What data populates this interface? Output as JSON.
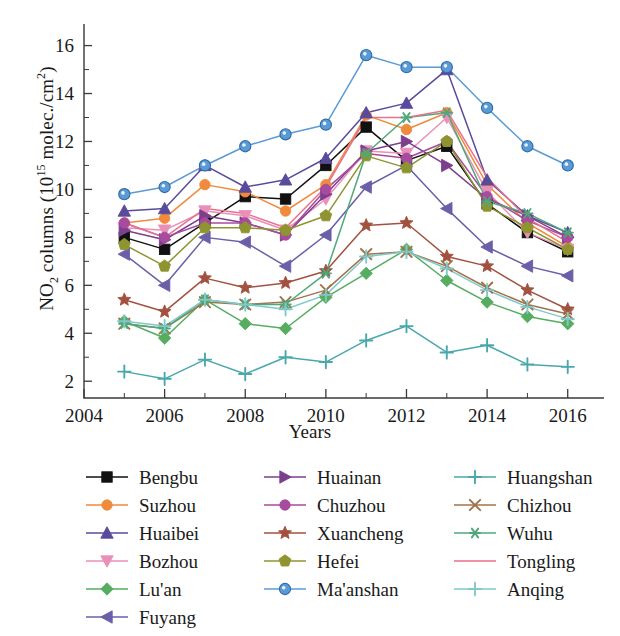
{
  "figure": {
    "y_axis_title_html": "NO<sub>2</sub> columns (10<sup>15</sup> molec./cm<sup>2</sup>)",
    "y_axis_title_text": "NO2 columns (10^15 molec./cm^2)",
    "x_axis_title": "Years"
  },
  "chart_data": {
    "type": "line",
    "title": "",
    "xlabel": "Years",
    "ylabel": "NO2 columns (10^15 molec./cm^2)",
    "x": [
      2005,
      2006,
      2007,
      2008,
      2009,
      2010,
      2011,
      2012,
      2013,
      2014,
      2015,
      2016
    ],
    "xlim": [
      2004,
      2016.9
    ],
    "ylim": [
      1.3,
      16.9
    ],
    "x_tick_values": [
      2004,
      2005,
      2006,
      2007,
      2008,
      2009,
      2010,
      2011,
      2012,
      2013,
      2014,
      2015,
      2016
    ],
    "x_tick_labels": [
      "2004",
      "",
      "2006",
      "",
      "2008",
      "",
      "2010",
      "",
      "2012",
      "",
      "2014",
      "",
      "2016"
    ],
    "y_ticks": [
      2,
      4,
      6,
      8,
      10,
      12,
      14,
      16
    ],
    "y_minor_ticks": [
      3,
      5,
      7,
      9,
      11,
      13,
      15
    ],
    "grid": false,
    "legend_position": "below",
    "legend_columns": 3,
    "series": [
      {
        "name": "Bengbu",
        "color": "#111111",
        "marker": "square",
        "values": [
          8.0,
          7.5,
          8.6,
          9.7,
          9.6,
          11.0,
          12.6,
          11.2,
          11.8,
          9.4,
          8.2,
          7.4
        ]
      },
      {
        "name": "Suzhou",
        "color": "#f08a3c",
        "marker": "circle",
        "values": [
          8.6,
          8.8,
          10.2,
          9.9,
          9.1,
          10.2,
          13.1,
          12.5,
          13.2,
          10.2,
          8.6,
          7.6
        ]
      },
      {
        "name": "Huaibei",
        "color": "#5a4a9c",
        "marker": "triangle-up",
        "values": [
          9.1,
          9.2,
          11.0,
          10.1,
          10.4,
          11.3,
          13.2,
          13.6,
          15.0,
          10.4,
          8.9,
          8.2
        ]
      },
      {
        "name": "Bozhou",
        "color": "#ea8fb8",
        "marker": "triangle-down",
        "values": [
          8.4,
          8.3,
          9.1,
          8.9,
          8.3,
          9.6,
          11.6,
          11.5,
          13.0,
          9.9,
          8.2,
          7.5
        ]
      },
      {
        "name": "Lu'an",
        "color": "#56ad60",
        "marker": "diamond",
        "values": [
          4.5,
          3.8,
          5.4,
          4.4,
          4.2,
          5.5,
          6.5,
          7.5,
          6.2,
          5.3,
          4.7,
          4.4
        ]
      },
      {
        "name": "Fuyang",
        "color": "#6a5fa8",
        "marker": "triangle-left",
        "values": [
          7.3,
          6.0,
          8.0,
          7.8,
          6.8,
          8.1,
          10.1,
          11.0,
          9.2,
          7.6,
          6.8,
          6.4
        ]
      },
      {
        "name": "Huainan",
        "color": "#7d3f8c",
        "marker": "triangle-right",
        "values": [
          8.3,
          7.9,
          8.9,
          8.6,
          8.1,
          9.8,
          11.6,
          12.0,
          11.0,
          9.6,
          8.9,
          8.0
        ]
      },
      {
        "name": "Chuzhou",
        "color": "#a84a9e",
        "marker": "circle",
        "values": [
          8.6,
          8.0,
          8.6,
          8.6,
          8.1,
          10.0,
          11.5,
          11.3,
          12.0,
          9.7,
          8.7,
          8.0
        ]
      },
      {
        "name": "Xuancheng",
        "color": "#a3513f",
        "marker": "star",
        "values": [
          5.4,
          4.9,
          6.3,
          5.9,
          6.1,
          6.6,
          8.5,
          8.6,
          7.2,
          6.8,
          5.8,
          5.0
        ]
      },
      {
        "name": "Hefei",
        "color": "#8e9430",
        "marker": "pentagon",
        "values": [
          7.7,
          6.8,
          8.4,
          8.4,
          8.3,
          8.9,
          11.4,
          10.9,
          12.0,
          9.3,
          8.4,
          7.5
        ]
      },
      {
        "name": "Ma'anshan",
        "color": "#5b9bd5",
        "marker": "circle-open",
        "values": [
          9.8,
          10.1,
          11.0,
          11.8,
          12.3,
          12.7,
          15.6,
          15.1,
          15.1,
          13.4,
          11.8,
          11.0
        ]
      },
      {
        "name": "Huangshan",
        "color": "#4aa8ac",
        "marker": "plus",
        "values": [
          2.4,
          2.1,
          2.9,
          2.3,
          3.0,
          2.8,
          3.7,
          4.3,
          3.2,
          3.5,
          2.7,
          2.6
        ]
      },
      {
        "name": "Chizhou",
        "color": "#a0734a",
        "marker": "x",
        "values": [
          4.4,
          4.2,
          5.3,
          5.2,
          5.3,
          5.8,
          7.3,
          7.4,
          6.8,
          5.9,
          5.2,
          4.8
        ]
      },
      {
        "name": "Wuhu",
        "color": "#4fa87a",
        "marker": "asterisk",
        "values": [
          4.4,
          4.2,
          5.4,
          5.2,
          5.2,
          6.5,
          11.5,
          13.0,
          13.2,
          9.5,
          9.0,
          8.2
        ]
      },
      {
        "name": "Tongling",
        "color": "#e8718c",
        "marker": "none",
        "values": [
          8.6,
          8.0,
          9.2,
          9.0,
          8.4,
          10.1,
          13.0,
          13.0,
          13.3,
          10.5,
          8.8,
          7.8
        ]
      },
      {
        "name": "Anqing",
        "color": "#7fc9cc",
        "marker": "plus",
        "values": [
          4.5,
          4.3,
          5.4,
          5.2,
          5.0,
          5.6,
          7.2,
          7.4,
          6.7,
          5.8,
          5.1,
          4.6
        ]
      }
    ]
  },
  "legend": {
    "columns": [
      {
        "items": [
          "Bengbu",
          "Suzhou",
          "Huaibei",
          "Bozhou",
          "Lu'an",
          "Fuyang"
        ]
      },
      {
        "items": [
          "Huainan",
          "Chuzhou",
          "Xuancheng",
          "Hefei",
          "Ma'anshan"
        ]
      },
      {
        "items": [
          "Huangshan",
          "Chizhou",
          "Wuhu",
          "Tongling",
          "Anqing"
        ]
      }
    ]
  }
}
